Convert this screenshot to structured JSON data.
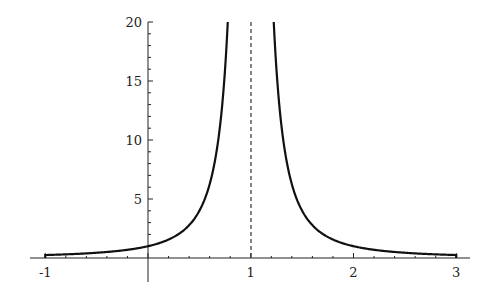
{
  "chart_data": {
    "type": "line",
    "title": "",
    "xlabel": "",
    "ylabel": "",
    "function": "y = 1/(x-1)^2",
    "xlim": [
      -1,
      3
    ],
    "ylim": [
      0,
      20
    ],
    "grid": false,
    "legend": null,
    "x_ticks": [
      "-1",
      "1",
      "2",
      "3"
    ],
    "y_ticks": [
      "5",
      "10",
      "15",
      "20"
    ],
    "asymptote": {
      "x": 1,
      "style": "dashed"
    },
    "series": [
      {
        "name": "1/(x-1)^2",
        "x": [
          -1,
          -0.5,
          0,
          0.25,
          0.5,
          0.6,
          0.7,
          0.776,
          1.224,
          1.3,
          1.4,
          1.5,
          1.75,
          2,
          2.5,
          3
        ],
        "values": [
          0.25,
          0.444,
          1,
          1.778,
          4,
          6.25,
          11.11,
          20,
          20,
          11.11,
          6.25,
          4,
          1.778,
          1,
          0.444,
          0.25
        ]
      }
    ],
    "colors": {
      "curve": "#111111",
      "axes": "#222222",
      "asymptote": "#333333"
    }
  }
}
